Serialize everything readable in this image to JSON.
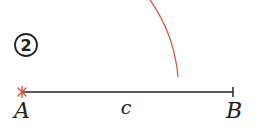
{
  "step": {
    "number": "2"
  },
  "segment": {
    "start_label": "A",
    "end_label": "B",
    "length_label": "c"
  },
  "colors": {
    "line": "#222222",
    "construction": "#d9553f",
    "text": "#222222"
  }
}
